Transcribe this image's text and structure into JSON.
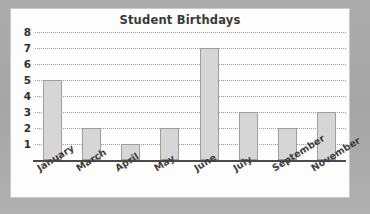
{
  "chart_data": {
    "type": "bar",
    "title": "Student Birthdays",
    "xlabel": "",
    "ylabel": "",
    "categories": [
      "January",
      "March",
      "April",
      "May",
      "June",
      "July",
      "September",
      "November"
    ],
    "values": [
      5,
      2,
      1,
      2,
      7,
      3,
      2,
      3
    ],
    "ytick_labels": [
      "8",
      "7",
      "6",
      "5",
      "4",
      "3",
      "2",
      "1"
    ],
    "ytick_values": [
      8,
      7,
      6,
      5,
      4,
      3,
      2,
      1
    ],
    "ylim": [
      0,
      8
    ],
    "grid": "horizontal-dotted",
    "legend": "none",
    "bar_fill": "#d6d6d6",
    "bar_stroke": "#9e9e9e",
    "title_color": "#3a3a3a",
    "label_color": "#3d3d3d",
    "grid_color": "#9a9a9a",
    "axis_color": "#4a4a4a",
    "panel_background": "#fdfdfd",
    "page_background": "#a9a9a9"
  }
}
